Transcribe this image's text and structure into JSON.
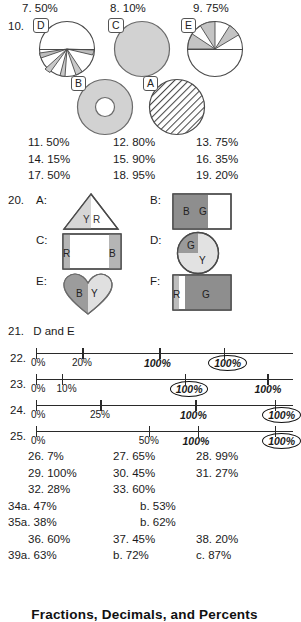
{
  "page": {
    "footer_title": "Fractions, Decimals, and Percents"
  },
  "top_answers": [
    {
      "number": "7.",
      "value": "50%"
    },
    {
      "number": "8.",
      "value": "10%"
    },
    {
      "number": "9.",
      "value": "75%"
    }
  ],
  "item10": {
    "number": "10.",
    "pies": [
      {
        "tag": "D",
        "fill_style": "wedges-narrow",
        "description": "circle with narrow gray wedges at bottom"
      },
      {
        "tag": "C",
        "fill_style": "full-shaded",
        "description": "fully shaded circle"
      },
      {
        "tag": "E",
        "fill_style": "alternating-wedges",
        "description": "top half with alternating gray wedges"
      },
      {
        "tag": "B",
        "fill_style": "donut-shaded",
        "description": "shaded donut with white center"
      },
      {
        "tag": "A",
        "fill_style": "diagonal-hatch",
        "description": "circle with diagonal hatching"
      }
    ]
  },
  "answers_11_19": [
    [
      {
        "number": "11.",
        "value": "50%"
      },
      {
        "number": "12.",
        "value": "80%"
      },
      {
        "number": "13.",
        "value": "75%"
      }
    ],
    [
      {
        "number": "14.",
        "value": "15%"
      },
      {
        "number": "15.",
        "value": "90%"
      },
      {
        "number": "16.",
        "value": "35%"
      }
    ],
    [
      {
        "number": "17.",
        "value": "50%"
      },
      {
        "number": "18.",
        "value": "95%"
      },
      {
        "number": "19.",
        "value": "20%"
      }
    ]
  ],
  "item20": {
    "number": "20.",
    "shapes": [
      {
        "key": "A:",
        "form": "triangle",
        "letters": [
          "Y",
          "R"
        ]
      },
      {
        "key": "B:",
        "form": "rectangle",
        "letters": [
          "B",
          "G"
        ]
      },
      {
        "key": "C:",
        "form": "rectangle",
        "letters": [
          "R",
          "B"
        ]
      },
      {
        "key": "D:",
        "form": "circle",
        "letters": [
          "G",
          "Y"
        ]
      },
      {
        "key": "E:",
        "form": "heart",
        "letters": [
          "B",
          "Y"
        ]
      },
      {
        "key": "F:",
        "form": "rectangle",
        "letters": [
          "R",
          "G"
        ]
      }
    ]
  },
  "item21": {
    "number": "21.",
    "value": "D and E"
  },
  "number_lines": [
    {
      "number": "22.",
      "printed_labels": [
        {
          "text": "0%",
          "pos": 0
        },
        {
          "text": "20%",
          "pos": 18
        }
      ],
      "handwritten_labels": [
        {
          "text": "100%",
          "pos": 48
        }
      ],
      "circled_labels": [
        {
          "text": "100%",
          "pos": 73
        }
      ],
      "ticks": [
        0,
        18,
        48,
        73
      ]
    },
    {
      "number": "23.",
      "printed_labels": [
        {
          "text": "0%",
          "pos": 0
        },
        {
          "text": "10%",
          "pos": 10
        }
      ],
      "handwritten_labels": [
        {
          "text": "100%",
          "pos": 90
        }
      ],
      "circled_labels": [
        {
          "text": "100%",
          "pos": 58
        }
      ],
      "ticks": [
        0,
        10,
        58,
        90
      ]
    },
    {
      "number": "24.",
      "printed_labels": [
        {
          "text": "0%",
          "pos": 0
        },
        {
          "text": "25%",
          "pos": 25
        }
      ],
      "handwritten_labels": [
        {
          "text": "100%",
          "pos": 62
        }
      ],
      "circled_labels": [
        {
          "text": "100%",
          "pos": 93
        }
      ],
      "ticks": [
        0,
        25,
        62,
        93
      ]
    },
    {
      "number": "25.",
      "printed_labels": [
        {
          "text": "0%",
          "pos": 0
        },
        {
          "text": "50%",
          "pos": 44
        }
      ],
      "handwritten_labels": [
        {
          "text": "100%",
          "pos": 63
        }
      ],
      "circled_labels": [
        {
          "text": "100%",
          "pos": 93
        }
      ],
      "ticks": [
        0,
        44,
        63,
        93
      ]
    }
  ],
  "answers_26_33": [
    [
      {
        "number": "26.",
        "value": "7%"
      },
      {
        "number": "27.",
        "value": "65%"
      },
      {
        "number": "28.",
        "value": "99%"
      }
    ],
    [
      {
        "number": "29.",
        "value": "100%"
      },
      {
        "number": "30.",
        "value": "45%"
      },
      {
        "number": "31.",
        "value": "27%"
      }
    ],
    [
      {
        "number": "32.",
        "value": "28%"
      },
      {
        "number": "33.",
        "value": "60%"
      }
    ]
  ],
  "answers_34_35": [
    {
      "a_number": "34a.",
      "a_value": "47%",
      "b_number": "b.",
      "b_value": "53%"
    },
    {
      "a_number": "35a.",
      "a_value": "38%",
      "b_number": "b.",
      "b_value": "62%"
    }
  ],
  "answers_36_38": [
    {
      "number": "36.",
      "value": "60%"
    },
    {
      "number": "37.",
      "value": "45%"
    },
    {
      "number": "38.",
      "value": "20%"
    }
  ],
  "answers_39": {
    "a_number": "39a.",
    "a_value": "63%",
    "b_number": "b.",
    "b_value": "72%",
    "c_number": "c.",
    "c_value": "87%"
  }
}
